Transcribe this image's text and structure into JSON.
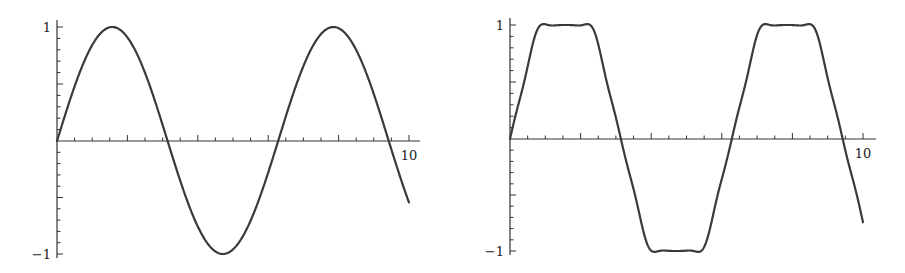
{
  "chart_data": [
    {
      "type": "line",
      "title": "",
      "xlabel": "",
      "ylabel": "",
      "xlim": [
        0,
        10
      ],
      "ylim": [
        -1,
        1
      ],
      "grid": false,
      "x_tick_labels": [
        "10"
      ],
      "y_tick_labels": [
        "1",
        "-1"
      ],
      "x_major_step": 2,
      "x_minor_step": 0.5,
      "y_minor_step": 0.1,
      "series": [
        {
          "name": "sin(x)",
          "function": "sin",
          "x": [
            0,
            0.5,
            1,
            1.57,
            2,
            2.5,
            3,
            3.14,
            3.5,
            4,
            4.71,
            5,
            5.5,
            6,
            6.28,
            6.5,
            7,
            7.5,
            7.85,
            8,
            8.5,
            9,
            9.42,
            10
          ],
          "y": [
            0,
            0.48,
            0.84,
            1.0,
            0.91,
            0.6,
            0.14,
            0,
            -0.35,
            -0.76,
            -1.0,
            -0.96,
            -0.71,
            -0.28,
            0,
            0.22,
            0.66,
            0.94,
            1.0,
            0.99,
            0.8,
            0.41,
            0,
            -0.54
          ]
        }
      ],
      "px": {
        "originX": 57,
        "originY": 141,
        "xEnd": 409,
        "axisXEnd": 420,
        "yTop": 27,
        "yBottom": 254,
        "axisYTop": 20,
        "axisYBottom": 258
      }
    },
    {
      "type": "line",
      "title": "",
      "xlabel": "",
      "ylabel": "",
      "xlim": [
        0,
        10
      ],
      "ylim": [
        -1,
        1
      ],
      "grid": false,
      "x_tick_labels": [
        "10"
      ],
      "y_tick_labels": [
        "1",
        "-1"
      ],
      "x_major_step": 2,
      "x_minor_step": 0.5,
      "y_minor_step": 0.1,
      "series": [
        {
          "name": "trapezoidal wave (Fourier approximation with ripple)",
          "function": "trapezoid",
          "x": [
            0,
            0.8,
            1.05,
            1.3,
            1.55,
            1.8,
            2.05,
            2.3,
            3.14,
            3.98,
            4.23,
            4.48,
            4.73,
            4.98,
            5.23,
            5.48,
            6.28,
            7.08,
            7.33,
            7.58,
            7.83,
            8.08,
            8.33,
            8.58,
            9.42,
            10
          ],
          "y": [
            0,
            1.0,
            0.94,
            1.0,
            0.94,
            1.0,
            0.94,
            1.0,
            0,
            -1.0,
            -0.94,
            -1.0,
            -0.94,
            -1.0,
            -0.94,
            -1.0,
            0,
            1.0,
            0.94,
            1.0,
            0.94,
            1.0,
            0.94,
            1.0,
            0,
            -0.68
          ]
        }
      ],
      "px": {
        "originX": 60,
        "originY": 139,
        "xEnd": 413,
        "axisXEnd": 426,
        "yTop": 25,
        "yBottom": 251,
        "axisYTop": 18,
        "axisYBottom": 255
      }
    }
  ],
  "charts": [
    {
      "x_label_10": "10",
      "y_label_top": "1",
      "y_label_bottom": "−1"
    },
    {
      "x_label_10": "10",
      "y_label_top": "1",
      "y_label_bottom": "−1"
    }
  ]
}
